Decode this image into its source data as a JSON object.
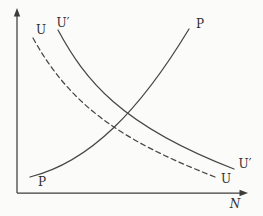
{
  "figure": {
    "background_color": "#fbfbf9",
    "line_color": "#3c3c3c",
    "text_color": "#2e2e2e",
    "labels": {
      "u_top": "U",
      "u_prime_top": "U′",
      "p_top": "P",
      "p_bottom": "P",
      "u_prime_right": "U′",
      "u_bottom": "U",
      "x_axis": "N"
    },
    "geometry": {
      "y_axis_path": "M 17 193 L 17 14",
      "x_axis_path": "M 17 193 L 243 193",
      "y_arrow_points": "17,8 13.8,16.5 20.2,16.5",
      "x_arrow_points": "248,193 239.5,189.8 239.5,196.2",
      "p_curve_path": "M 30 177 C 90 162, 140 110, 189 29",
      "u_prime_curve_path": "M 58 30 C 85 80, 120 125, 234 169",
      "u_dashed_curve_path": "M 33 38 C 70 105, 120 140, 215 177"
    }
  },
  "chart_data": {
    "type": "line",
    "title": "",
    "xlabel": "N",
    "ylabel": "",
    "axes_numeric": false,
    "grid": false,
    "legend": "none",
    "series": [
      {
        "name": "P",
        "style": "solid",
        "shape": "upward-sloping, convex (increasing slope)",
        "endpoint_labels": [
          "P (bottom-left)",
          "P (top-right)"
        ],
        "points_px": [
          [
            30,
            177
          ],
          [
            73,
            159
          ],
          [
            114,
            128
          ],
          [
            152,
            84
          ],
          [
            189,
            29
          ]
        ]
      },
      {
        "name": "U′",
        "style": "solid",
        "shape": "downward-sloping, convex (flattening)",
        "endpoint_labels": [
          "U′ (top-left)",
          "U′ (bottom-right)"
        ],
        "points_px": [
          [
            58,
            30
          ],
          [
            83,
            67
          ],
          [
            113,
            102
          ],
          [
            162,
            136
          ],
          [
            234,
            169
          ]
        ]
      },
      {
        "name": "U",
        "style": "dashed",
        "shape": "downward-sloping, convex (flattening), below/left of U′",
        "endpoint_labels": [
          "U (top-left)",
          "U (bottom-right)"
        ],
        "points_px": [
          [
            33,
            38
          ],
          [
            60,
            77
          ],
          [
            102,
            119
          ],
          [
            152,
            149
          ],
          [
            215,
            177
          ]
        ]
      }
    ],
    "intersections_px": {
      "p_with_u_dashed": [
        114,
        127
      ],
      "p_with_u_prime": [
        128,
        113
      ]
    }
  }
}
